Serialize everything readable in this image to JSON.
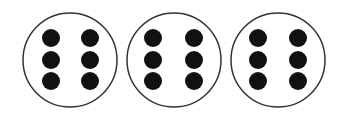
{
  "diagram": {
    "groups": [
      {
        "label": "group-1",
        "cx": 70,
        "cy": 60,
        "r": 47,
        "dots": 6,
        "dot_positions": [
          [
            51,
            38
          ],
          [
            90,
            38
          ],
          [
            51,
            60
          ],
          [
            90,
            60
          ],
          [
            51,
            81
          ],
          [
            90,
            81
          ]
        ]
      },
      {
        "label": "group-2",
        "cx": 174,
        "cy": 60,
        "r": 47,
        "dots": 6,
        "dot_positions": [
          [
            153,
            38
          ],
          [
            194,
            38
          ],
          [
            153,
            60
          ],
          [
            194,
            60
          ],
          [
            153,
            81
          ],
          [
            194,
            81
          ]
        ]
      },
      {
        "label": "group-3",
        "cx": 278,
        "cy": 60,
        "r": 47,
        "dots": 6,
        "dot_positions": [
          [
            258,
            38
          ],
          [
            298,
            38
          ],
          [
            258,
            60
          ],
          [
            298,
            60
          ],
          [
            258,
            81
          ],
          [
            298,
            81
          ]
        ]
      }
    ],
    "dot_radius": 9,
    "colors": {
      "circle_stroke": "#333333",
      "dot_fill": "#111111",
      "background": "#ffffff"
    }
  }
}
